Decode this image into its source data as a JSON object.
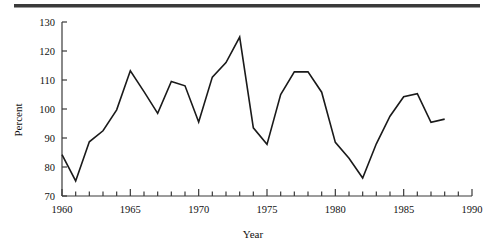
{
  "figure": {
    "background_color": "#ffffff",
    "line_color": "#1a1a1a",
    "axis_color": "#3a3a3a",
    "top_rule_color": "#3a3a3a"
  },
  "chart_data": {
    "type": "line",
    "title": "",
    "xlabel": "Year",
    "ylabel": "Percent",
    "xlim": [
      1960,
      1990
    ],
    "ylim": [
      70,
      130
    ],
    "xticks": [
      1960,
      1965,
      1970,
      1975,
      1980,
      1985,
      1990
    ],
    "xtick_labels": [
      "1960",
      "1965",
      "1970",
      "1975",
      "1980",
      "1985",
      "1990"
    ],
    "xminor_tick_step": 1,
    "yticks": [
      70,
      80,
      90,
      100,
      110,
      120,
      130
    ],
    "ytick_labels": [
      "70",
      "80",
      "90",
      "100",
      "110",
      "120",
      "130"
    ],
    "grid": false,
    "legend": false,
    "legend_position": "none",
    "x": [
      1960,
      1961,
      1962,
      1963,
      1964,
      1965,
      1966,
      1967,
      1968,
      1969,
      1970,
      1971,
      1972,
      1973,
      1974,
      1975,
      1976,
      1977,
      1978,
      1979,
      1980,
      1981,
      1982,
      1983,
      1984,
      1985,
      1986,
      1987,
      1988
    ],
    "values": [
      84.3,
      75.2,
      88.7,
      92.5,
      99.7,
      113.2,
      106.0,
      98.5,
      109.5,
      108.0,
      95.5,
      111.0,
      116.0,
      124.8,
      93.5,
      87.8,
      105.0,
      112.8,
      112.8,
      105.8,
      88.5,
      83.0,
      76.2,
      88.0,
      97.5,
      104.2,
      105.3,
      95.4,
      96.5
    ],
    "series": [
      {
        "name": "Percent",
        "values": [
          84.3,
          75.2,
          88.7,
          92.5,
          99.7,
          113.2,
          106.0,
          98.5,
          109.5,
          108.0,
          95.5,
          111.0,
          116.0,
          124.8,
          93.5,
          87.8,
          105.0,
          112.8,
          112.8,
          105.8,
          88.5,
          83.0,
          76.2,
          88.0,
          97.5,
          104.2,
          105.3,
          95.4,
          96.5
        ]
      }
    ]
  }
}
